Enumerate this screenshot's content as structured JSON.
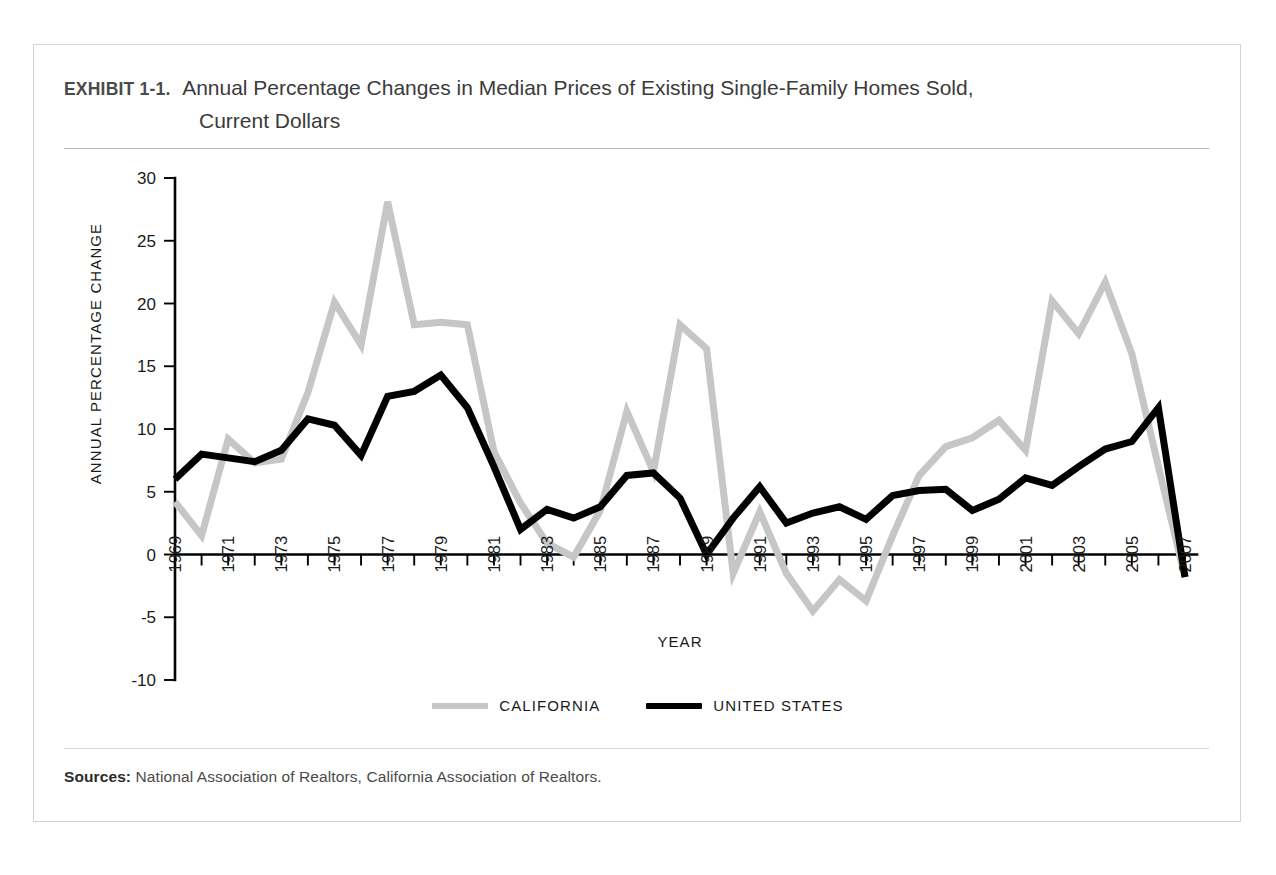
{
  "exhibit": {
    "label": "EXHIBIT 1-1.",
    "title_line_1": "Annual Percentage Changes in Median Prices of Existing Single-Family Homes Sold,",
    "title_line_2": "Current Dollars"
  },
  "sources": {
    "label": "Sources:",
    "text": " National Association of Realtors, California Association of Realtors."
  },
  "legend": {
    "items": [
      {
        "label": "CALIFORNIA",
        "color": "#c6c6c6"
      },
      {
        "label": "UNITED STATES",
        "color": "#000000"
      }
    ]
  },
  "chart_data": {
    "type": "line",
    "title": "Annual Percentage Changes in Median Prices of Existing Single-Family Homes Sold, Current Dollars",
    "xlabel": "YEAR",
    "ylabel": "ANNUAL PERCENTAGE CHANGE",
    "xlim": [
      1969,
      2007
    ],
    "ylim": [
      -10,
      30
    ],
    "yticks": [
      30,
      25,
      20,
      15,
      10,
      5,
      0,
      -5,
      -10
    ],
    "ytick_labels": [
      "30",
      "25",
      "20",
      "15",
      "10",
      "5",
      "0",
      "-5",
      "-10"
    ],
    "xticks": [
      1969,
      1970,
      1971,
      1972,
      1973,
      1974,
      1975,
      1976,
      1977,
      1978,
      1979,
      1980,
      1981,
      1982,
      1983,
      1984,
      1985,
      1986,
      1987,
      1988,
      1989,
      1990,
      1991,
      1992,
      1993,
      1994,
      1995,
      1996,
      1997,
      1998,
      1999,
      2000,
      2001,
      2002,
      2003,
      2004,
      2005,
      2006,
      2007
    ],
    "xtick_labels": [
      "1969",
      "",
      "1971",
      "",
      "1973",
      "",
      "1975",
      "",
      "1977",
      "",
      "1979",
      "",
      "1981",
      "",
      "1983",
      "",
      "1985",
      "",
      "1987",
      "",
      "1989",
      "",
      "1991",
      "",
      "1993",
      "",
      "1995",
      "",
      "1997",
      "",
      "1999",
      "",
      "2001",
      "",
      "2003",
      "",
      "2005",
      "",
      "2007"
    ],
    "grid": false,
    "legend_position": "bottom",
    "x": [
      1969,
      1970,
      1971,
      1972,
      1973,
      1974,
      1975,
      1976,
      1977,
      1978,
      1979,
      1980,
      1981,
      1982,
      1983,
      1984,
      1985,
      1986,
      1987,
      1988,
      1989,
      1990,
      1991,
      1992,
      1993,
      1994,
      1995,
      1996,
      1997,
      1998,
      1999,
      2000,
      2001,
      2002,
      2003,
      2004,
      2005,
      2006,
      2007
    ],
    "series": [
      {
        "name": "CALIFORNIA",
        "color": "#c6c6c6",
        "width": 7,
        "values": [
          4.2,
          1.5,
          9.2,
          7.3,
          7.6,
          12.9,
          20.1,
          16.7,
          28.1,
          18.3,
          18.5,
          18.3,
          8.2,
          4.1,
          0.9,
          -0.2,
          3.5,
          11.4,
          6.6,
          18.3,
          16.4,
          -1.5,
          3.4,
          -1.5,
          -4.5,
          -2.0,
          -3.7,
          1.5,
          6.3,
          8.6,
          9.3,
          10.7,
          8.3,
          20.2,
          17.6,
          21.7,
          16.0,
          7.0,
          -1.8
        ]
      },
      {
        "name": "UNITED STATES",
        "color": "#000000",
        "width": 7,
        "values": [
          6.0,
          8.0,
          7.7,
          7.4,
          8.3,
          10.8,
          10.3,
          7.9,
          12.6,
          13.0,
          14.3,
          11.7,
          7.0,
          2.0,
          3.6,
          2.9,
          3.8,
          6.3,
          6.5,
          4.5,
          0.0,
          2.9,
          5.4,
          2.5,
          3.3,
          3.8,
          2.8,
          4.7,
          5.1,
          5.2,
          3.5,
          4.4,
          6.1,
          5.5,
          7.0,
          8.4,
          9.0,
          11.7,
          -1.8
        ]
      }
    ]
  }
}
